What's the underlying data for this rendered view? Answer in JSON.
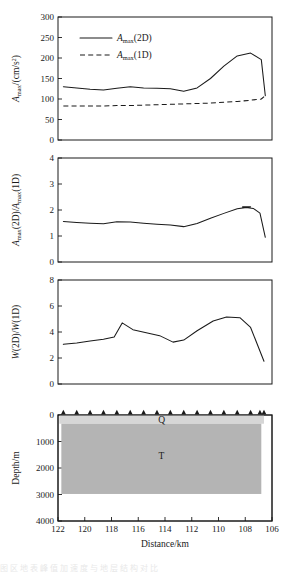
{
  "figure": {
    "xlabel": "Distance/km",
    "x_ticks": [
      122,
      120,
      118,
      116,
      114,
      112,
      110,
      108,
      106
    ],
    "x_range": [
      122,
      106
    ],
    "caption_fragment": "图 区 地 表 峰 值 加 速 度 与 地 层 结 构 对 比"
  },
  "panel1": {
    "ylabel_main": "A",
    "ylabel_sub": "max",
    "ylabel_rest": "/(cm/s",
    "ylabel_sup": "2",
    "ylabel_end": ")",
    "ylabel_plain": "Amax/(cm/s2)",
    "y_ticks": [
      0,
      50,
      100,
      150,
      200,
      250,
      300
    ],
    "ylim": [
      0,
      300
    ],
    "legend": [
      {
        "label_main": "A",
        "label_sub": "max",
        "label_rest": "(2D)",
        "style": "solid",
        "plain": "Amax(2D)"
      },
      {
        "label_main": "A",
        "label_sub": "max",
        "label_rest": "(1D)",
        "style": "dashed",
        "plain": "Amax(1D)"
      }
    ]
  },
  "panel2": {
    "ylabel_plain": "Amax(2D)/Amax(1D)",
    "y_ticks": [
      0,
      1,
      2,
      3,
      4
    ],
    "ylim": [
      0,
      4
    ]
  },
  "panel3": {
    "ylabel_plain": "W(2D)/W(1D)",
    "y_ticks": [
      0,
      2,
      4,
      6,
      8
    ],
    "ylim": [
      0,
      8
    ]
  },
  "panel4": {
    "ylabel": "Depth/m",
    "y_ticks": [
      0,
      1000,
      2000,
      3000,
      4000
    ],
    "ylim": [
      0,
      4000
    ],
    "layers": [
      {
        "name": "Q",
        "label": "Q",
        "color": "#d6d6d6",
        "top_depth": 0,
        "bottom_depth": 330
      },
      {
        "name": "T",
        "label": "T",
        "color": "#b4b4b4",
        "top_depth": 330,
        "bottom_depth": 2980
      }
    ],
    "station_count": 17
  },
  "chart_data": [
    {
      "type": "line",
      "panel": 1,
      "title": "",
      "xlabel": "Distance/km",
      "ylabel": "Amax/(cm/s2)",
      "xlim": [
        122,
        106
      ],
      "ylim": [
        0,
        300
      ],
      "grid": false,
      "legend_position": "top-left",
      "x": [
        121.6,
        120.6,
        119.6,
        118.6,
        117.6,
        116.6,
        115.6,
        114.6,
        113.6,
        112.6,
        111.6,
        110.6,
        109.6,
        108.6,
        107.6,
        106.8
      ],
      "series": [
        {
          "name": "Amax(2D)",
          "style": "solid",
          "values": [
            130,
            127,
            124,
            122,
            126,
            130,
            127,
            126,
            125,
            119,
            127,
            150,
            180,
            205,
            212,
            196
          ]
        },
        {
          "name": "Amax(1D)",
          "style": "dashed",
          "values": [
            83,
            83,
            83,
            83,
            84,
            84,
            85,
            86,
            87,
            88,
            89,
            90,
            92,
            94,
            97,
            100
          ]
        }
      ],
      "tail_x": [
        106.8,
        106.5
      ],
      "tail_solid": [
        196,
        108
      ],
      "tail_dashed": [
        100,
        108
      ]
    },
    {
      "type": "line",
      "panel": 2,
      "title": "",
      "xlabel": "Distance/km",
      "ylabel": "Amax(2D)/Amax(1D)",
      "xlim": [
        122,
        106
      ],
      "ylim": [
        0,
        4
      ],
      "grid": false,
      "x": [
        121.6,
        120.6,
        119.6,
        118.6,
        117.6,
        116.6,
        115.6,
        114.6,
        113.6,
        112.6,
        111.6,
        110.6,
        109.6,
        108.6,
        107.6,
        106.5
      ],
      "values": [
        1.56,
        1.52,
        1.49,
        1.47,
        1.55,
        1.54,
        1.49,
        1.45,
        1.42,
        1.36,
        1.48,
        1.68,
        1.87,
        2.05,
        2.12,
        0.95
      ],
      "extra_x": [
        108.2,
        107.4,
        106.9,
        106.5
      ],
      "extra_values": [
        2.12,
        2.06,
        1.88,
        0.95
      ]
    },
    {
      "type": "line",
      "panel": 3,
      "title": "",
      "xlabel": "Distance/km",
      "ylabel": "W(2D)/W(1D)",
      "xlim": [
        122,
        106
      ],
      "ylim": [
        0,
        8
      ],
      "grid": false,
      "x": [
        121.6,
        120.6,
        119.6,
        118.6,
        117.8,
        117.2,
        116.4,
        115.4,
        114.4,
        113.4,
        112.6,
        111.6,
        110.4,
        109.4,
        108.4,
        107.6,
        106.6
      ],
      "values": [
        3.05,
        3.15,
        3.3,
        3.45,
        3.62,
        4.7,
        4.18,
        3.95,
        3.72,
        3.22,
        3.38,
        4.1,
        4.85,
        5.15,
        5.1,
        4.35,
        1.75
      ]
    },
    {
      "type": "area",
      "panel": 4,
      "title": "",
      "xlabel": "Distance/km",
      "ylabel": "Depth/m",
      "xlim": [
        122,
        106
      ],
      "ylim": [
        4000,
        0
      ],
      "grid": false,
      "layers": [
        {
          "name": "Q",
          "top": 0,
          "bottom": 330,
          "x_start": 121.9,
          "x_end": 106.6,
          "color": "#d6d6d6"
        },
        {
          "name": "T",
          "top": 330,
          "bottom": 2980,
          "x_start": 121.75,
          "x_end": 106.8,
          "color": "#b4b4b4"
        }
      ],
      "stations_x": [
        121.6,
        120.6,
        119.6,
        118.6,
        117.6,
        116.6,
        115.6,
        114.6,
        113.6,
        112.6,
        111.6,
        110.6,
        109.6,
        108.6,
        107.6,
        106.9,
        106.6
      ]
    }
  ]
}
